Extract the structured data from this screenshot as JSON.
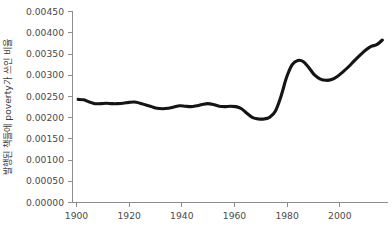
{
  "chart_data": {
    "type": "line",
    "title": "",
    "subtitle": "",
    "xlabel": "",
    "ylabel": "발행된 책들에 poverty가 쓰인 비율",
    "xlim": [
      1898,
      2010
    ],
    "ylim": [
      0.0,
      0.0045
    ],
    "grid": false,
    "legend": null,
    "legend_position": "none",
    "line_color": "#141414",
    "axis_color": "#8c8c8c",
    "tick_label_color": "#4a4a4a",
    "background_color": "#ffffff",
    "xticks": [
      1900,
      1920,
      1940,
      1960,
      1980,
      2000
    ],
    "xtick_labels": [
      "1900",
      "1920",
      "1940",
      "1960",
      "1980",
      "2000"
    ],
    "yticks": [
      0.0,
      0.0005,
      0.001,
      0.0015,
      0.002,
      0.0025,
      0.003,
      0.0035,
      0.004,
      0.0045
    ],
    "ytick_labels": [
      "0.00000",
      "0.00050",
      "0.00100",
      "0.00150",
      "0.00200",
      "0.00250",
      "0.00300",
      "0.00350",
      "0.00400",
      "0.00450"
    ],
    "series": [
      {
        "name": "poverty",
        "x": [
          1900,
          1902,
          1904,
          1906,
          1908,
          1910,
          1912,
          1914,
          1916,
          1918,
          1920,
          1922,
          1924,
          1926,
          1928,
          1930,
          1932,
          1934,
          1936,
          1938,
          1940,
          1942,
          1944,
          1946,
          1948,
          1950,
          1952,
          1954,
          1956,
          1958,
          1960,
          1962,
          1964,
          1966,
          1968,
          1970,
          1972,
          1974,
          1976,
          1978,
          1980,
          1982,
          1984,
          1986,
          1988,
          1990,
          1992,
          1994,
          1996,
          1998,
          2000,
          2002,
          2004,
          2006,
          2008
        ],
        "values": [
          0.00243,
          0.00242,
          0.00237,
          0.00233,
          0.00233,
          0.00234,
          0.00233,
          0.00233,
          0.00234,
          0.00236,
          0.00237,
          0.00234,
          0.0023,
          0.00226,
          0.00222,
          0.00221,
          0.00222,
          0.00225,
          0.00228,
          0.00227,
          0.00226,
          0.00228,
          0.00231,
          0.00233,
          0.00231,
          0.00227,
          0.00226,
          0.00227,
          0.00226,
          0.00221,
          0.0021,
          0.002,
          0.00197,
          0.00197,
          0.00201,
          0.00215,
          0.0025,
          0.00295,
          0.00325,
          0.00335,
          0.00332,
          0.00317,
          0.003,
          0.00291,
          0.00288,
          0.0029,
          0.00297,
          0.00308,
          0.0032,
          0.00334,
          0.00347,
          0.00359,
          0.00368,
          0.00372,
          0.00383
        ]
      }
    ],
    "annotations": [
      {
        "label": "start",
        "x": 1900,
        "y": 0.00243
      },
      {
        "label": "mid-century-plateau",
        "x": 1946,
        "y": 0.00233
      },
      {
        "label": "trough",
        "x": 1964,
        "y": 0.00197
      },
      {
        "label": "1970s-peak",
        "x": 1978,
        "y": 0.00335
      },
      {
        "label": "1980s-local-min",
        "x": 1988,
        "y": 0.00288
      },
      {
        "label": "end",
        "x": 2008,
        "y": 0.00396
      }
    ]
  },
  "figure": {
    "name": "poverty-word-frequency-chart"
  }
}
